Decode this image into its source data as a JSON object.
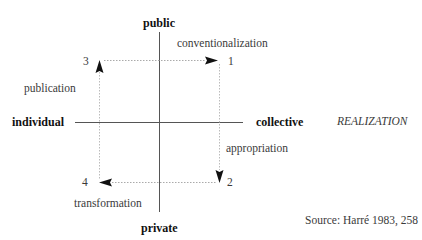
{
  "axes": {
    "top": "public",
    "bottom": "private",
    "left": "individual",
    "right": "collective"
  },
  "corners": {
    "one": "1",
    "two": "2",
    "three": "3",
    "four": "4"
  },
  "transitions": {
    "top": "conventionalization",
    "right": "appropriation",
    "bottom": "transformation",
    "left": "publication"
  },
  "side_label": "REALIZATION",
  "source": "Source: Harré 1983, 258",
  "colors": {
    "axis": "#555555",
    "dotted": "#aaaaaa",
    "arrow": "#111111"
  }
}
